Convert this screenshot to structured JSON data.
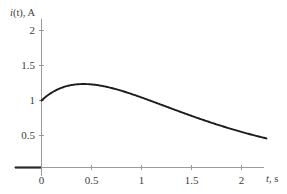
{
  "chart_data": {
    "type": "line",
    "title": "",
    "subtitle": "",
    "xlabel": "t, s",
    "ylabel": "i(t), A",
    "ylabel_symbol": "i",
    "ylabel_arg": "(t)",
    "ylabel_unit": "A",
    "xlabel_symbol": "t",
    "xlabel_unit": "s",
    "xlim": [
      -0.2,
      2.35
    ],
    "ylim": [
      0,
      2.15
    ],
    "xticks": [
      0,
      0.5,
      1,
      1.5,
      2
    ],
    "xticklabels": [
      "0",
      "0.5",
      "1",
      "1.5",
      "2"
    ],
    "yticks": [
      0.5,
      1,
      1.5,
      2
    ],
    "yticklabels": [
      "0.5",
      "1",
      "1.5",
      "2"
    ],
    "grid": false,
    "legend": null,
    "legend_position": "none",
    "series": [
      {
        "name": "i(t)",
        "color": "#1c1c1c",
        "x": [
          0,
          0.05,
          0.1,
          0.15,
          0.2,
          0.25,
          0.3,
          0.35,
          0.4,
          0.45,
          0.5,
          0.55,
          0.6,
          0.65,
          0.7,
          0.75,
          0.8,
          0.85,
          0.9,
          0.95,
          1,
          1.1,
          1.2,
          1.3,
          1.4,
          1.5,
          1.6,
          1.7,
          1.8,
          1.9,
          2,
          2.1,
          2.2,
          2.25
        ],
        "y": [
          1,
          1.078,
          1.15,
          1.215,
          1.273,
          1.325,
          1.37,
          1.41,
          1.444,
          1.473,
          1.497,
          1.517,
          1.532,
          1.544,
          1.551,
          1.556,
          1.557,
          1.555,
          1.551,
          1.544,
          1.535,
          1.511,
          1.481,
          1.446,
          1.406,
          1.364,
          1.319,
          1.272,
          1.224,
          1.175,
          1.126,
          1.077,
          1.029,
          1.005
        ]
      }
    ],
    "annotations": {
      "start_value": 1,
      "peak_value": 1.55,
      "peak_time": 0.5,
      "end_value": 0.45,
      "end_time": 2.25
    },
    "axis_color": "#9a9a9a",
    "curve_color": "#1c1c1c",
    "background_color": "#ffffff"
  }
}
